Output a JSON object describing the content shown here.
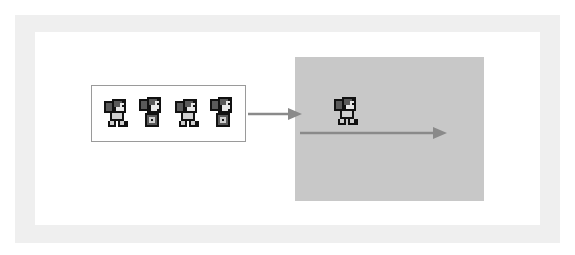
{
  "diagram": {
    "title": "",
    "sprite_sheet": {
      "frame_count": 4,
      "frames": [
        {
          "index": 1,
          "pose": "walk-side-a"
        },
        {
          "index": 2,
          "pose": "facing-forward-a"
        },
        {
          "index": 3,
          "pose": "walk-side-b"
        },
        {
          "index": 4,
          "pose": "facing-forward-b"
        }
      ]
    },
    "flow_arrow": {
      "from": "sprite-sheet",
      "to": "game-panel"
    },
    "game_panel": {
      "character_pose": "walk-side-a",
      "motion_direction": "right"
    }
  },
  "colors": {
    "outer_frame": "#efefef",
    "canvas": "#ffffff",
    "strip_border": "#9a9a9a",
    "panel": "#c8c8c8",
    "arrow": "#8a8a8a",
    "sprite_outline": "#111111",
    "sprite_dark": "#5a5a5a",
    "sprite_light": "#cfcfcf"
  }
}
